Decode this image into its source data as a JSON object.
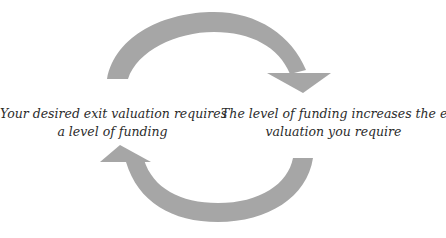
{
  "diagram": {
    "type": "cycle",
    "arrow_color": "#a6a6a6",
    "text_color": "#2b2b2b",
    "nodes": [
      {
        "id": "left",
        "line1": "Your desired exit valuation requires",
        "line2": "a level of funding"
      },
      {
        "id": "right",
        "line1": "The level of funding increases the exit",
        "line2": "valuation you require"
      }
    ],
    "arrows": [
      {
        "name": "top-arrow",
        "from": "left",
        "to": "right",
        "direction": "clockwise"
      },
      {
        "name": "bottom-arrow",
        "from": "right",
        "to": "left",
        "direction": "clockwise"
      }
    ]
  }
}
